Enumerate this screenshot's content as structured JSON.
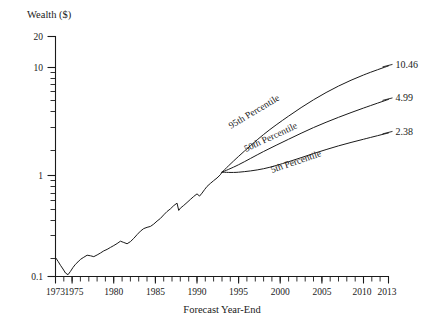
{
  "chart_data": {
    "type": "line",
    "title": "",
    "ylabel": "Wealth ($)",
    "xlabel": "Forecast Year-End",
    "yscale": "log",
    "ylim": [
      0.1,
      20
    ],
    "xlim": [
      1973,
      2013
    ],
    "grid": false,
    "legend": "inline-curve-labels",
    "y_tick_labels": [
      "20",
      "10",
      "1",
      "0.1"
    ],
    "y_tick_values": [
      20,
      10,
      1,
      0.1
    ],
    "x_tick_labels": [
      "1973",
      "1975",
      "1980",
      "1985",
      "1990",
      "1995",
      "2000",
      "2005",
      "2010",
      "2013"
    ],
    "x_tick_values": [
      1973,
      1975,
      1980,
      1985,
      1990,
      1995,
      2000,
      2005,
      2010,
      2013
    ],
    "forecast_start_year": 1993,
    "forecast_start_value": 1.0,
    "series": [
      {
        "name": "Historical Wealth",
        "x": [
          1973.0,
          1973.3,
          1973.6,
          1973.9,
          1974.2,
          1974.5,
          1974.8,
          1975.1,
          1975.4,
          1975.7,
          1976.0,
          1976.4,
          1976.8,
          1977.2,
          1977.6,
          1978.0,
          1978.4,
          1978.8,
          1979.2,
          1979.6,
          1980.0,
          1980.4,
          1980.8,
          1981.2,
          1981.6,
          1982.0,
          1982.4,
          1982.8,
          1983.2,
          1983.6,
          1984.0,
          1984.4,
          1984.8,
          1985.2,
          1985.6,
          1986.0,
          1986.4,
          1986.8,
          1987.2,
          1987.6,
          1987.8,
          1988.0,
          1988.4,
          1988.8,
          1989.2,
          1989.6,
          1990.0,
          1990.3,
          1990.6,
          1990.9,
          1991.2,
          1991.6,
          1992.0,
          1992.4,
          1992.8,
          1993.0
        ],
        "y": [
          0.152,
          0.14,
          0.128,
          0.118,
          0.108,
          0.104,
          0.112,
          0.122,
          0.131,
          0.138,
          0.146,
          0.153,
          0.16,
          0.158,
          0.155,
          0.161,
          0.168,
          0.176,
          0.182,
          0.19,
          0.198,
          0.207,
          0.218,
          0.212,
          0.206,
          0.216,
          0.232,
          0.252,
          0.272,
          0.288,
          0.296,
          0.302,
          0.318,
          0.34,
          0.36,
          0.39,
          0.42,
          0.445,
          0.478,
          0.505,
          0.43,
          0.452,
          0.48,
          0.512,
          0.548,
          0.585,
          0.62,
          0.59,
          0.63,
          0.68,
          0.73,
          0.78,
          0.83,
          0.88,
          0.945,
          1.0
        ]
      },
      {
        "name": "95th Percentile",
        "label": "95th Percentile",
        "x": [
          1993,
          1995,
          1998,
          2001,
          2004,
          2007,
          2010,
          2013
        ],
        "y": [
          1.0,
          1.42,
          2.3,
          3.45,
          4.95,
          6.7,
          8.55,
          10.46
        ],
        "end_value": "10.46"
      },
      {
        "name": "50th Percentile",
        "label": "50th Percentile",
        "x": [
          1993,
          1995,
          1998,
          2001,
          2004,
          2007,
          2010,
          2013
        ],
        "y": [
          1.0,
          1.18,
          1.58,
          2.07,
          2.68,
          3.36,
          4.12,
          4.99
        ],
        "end_value": "4.99"
      },
      {
        "name": "5th Percentile",
        "label": "5th Percentile",
        "x": [
          1993,
          1995,
          1998,
          2001,
          2004,
          2007,
          2010,
          2013
        ],
        "y": [
          1.0,
          1.0,
          1.08,
          1.26,
          1.51,
          1.79,
          2.07,
          2.38
        ],
        "end_value": "2.38"
      }
    ],
    "annotations": [
      {
        "text": "95th Percentile",
        "kind": "curve-label"
      },
      {
        "text": "50th Percentile",
        "kind": "curve-label"
      },
      {
        "text": "5th Percentile",
        "kind": "curve-label"
      },
      {
        "text": "10.46",
        "kind": "endpoint-value"
      },
      {
        "text": "4.99",
        "kind": "endpoint-value"
      },
      {
        "text": "2.38",
        "kind": "endpoint-value"
      }
    ],
    "colors": {
      "ink": "#1a1a1a",
      "background": "#ffffff"
    }
  }
}
